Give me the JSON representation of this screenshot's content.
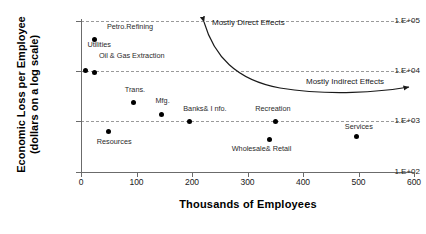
{
  "chart_data": {
    "type": "scatter",
    "title": "",
    "xlabel": "Thousands of Employees",
    "ylabel": "Economic Loss per Employee (dollars on a log scale)",
    "ylabel_line1": "Economic Loss per Employee",
    "ylabel_line2": "(dollars on a log scale)",
    "xlim": [
      0,
      600
    ],
    "ylim": [
      100,
      100000
    ],
    "yscale": "log",
    "grid": "horizontal-dashed",
    "legend": "none",
    "xticks": [
      0,
      100,
      200,
      300,
      400,
      500,
      600
    ],
    "xtick_labels": [
      "0",
      "100",
      "200",
      "300",
      "400",
      "500",
      "600"
    ],
    "yticks": [
      100,
      1000,
      10000,
      100000
    ],
    "ytick_labels": [
      "1.E+02",
      "1.E+03",
      "1.E+04",
      "1.E+05"
    ],
    "points": [
      {
        "label": "Petro.Refining",
        "x": 25,
        "y": 43000,
        "label_dx": 12,
        "label_dy": -16
      },
      {
        "label": "Utilities",
        "x": 8,
        "y": 10300,
        "label_dx": 2,
        "label_dy": -30
      },
      {
        "label": "Oil & Gas Extraction",
        "x": 25,
        "y": 9500,
        "label_dx": 4,
        "label_dy": -20
      },
      {
        "label": "Trans.",
        "x": 95,
        "y": 2400,
        "label_dx": -9,
        "label_dy": -17
      },
      {
        "label": "Mfg.",
        "x": 145,
        "y": 1400,
        "label_dx": -6,
        "label_dy": -17
      },
      {
        "label": "Banks& I nfo.",
        "x": 195,
        "y": 1000,
        "label_dx": -6,
        "label_dy": -17
      },
      {
        "label": "Resources",
        "x": 50,
        "y": 650,
        "label_dx": -12,
        "label_dy": 7
      },
      {
        "label": "Recreation",
        "x": 350,
        "y": 1000,
        "label_dx": -20,
        "label_dy": -17
      },
      {
        "label": "Wholesale& Retail",
        "x": 340,
        "y": 450,
        "label_dx": -38,
        "label_dy": 6
      },
      {
        "label": "Services",
        "x": 497,
        "y": 500,
        "label_dx": -12,
        "label_dy": -14
      }
    ],
    "annotations": [
      {
        "name": "mostly-direct-effects",
        "text": "Mostly Direct Effects",
        "x": 212,
        "y": 18
      },
      {
        "name": "mostly-indirect-effects",
        "text": "Mostly Indirect Effects",
        "x": 306,
        "y": 77
      }
    ],
    "colors": {
      "marker": "#000000",
      "axis": "#6b6b6b",
      "grid": "#9a9a9a",
      "text": "#000000",
      "background": "#ffffff"
    }
  }
}
